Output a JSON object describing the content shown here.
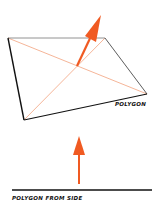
{
  "diagram": {
    "top": {
      "label": "POLYGON",
      "vertices": [
        [
          8,
          38
        ],
        [
          105,
          38
        ],
        [
          147,
          94
        ],
        [
          24,
          120
        ]
      ],
      "normal_arrow": {
        "from": [
          77,
          66
        ],
        "to": [
          101,
          15
        ]
      }
    },
    "bottom": {
      "label": "POLYGON FROM SIDE",
      "line": {
        "x1": 12,
        "x2": 152,
        "y": 190
      },
      "normal_arrow": {
        "from": [
          79,
          184
        ],
        "to": [
          79,
          136
        ]
      }
    },
    "colors": {
      "edge": "#111111",
      "diagonal": "#f2a27e",
      "arrow": "#f05a22"
    }
  }
}
